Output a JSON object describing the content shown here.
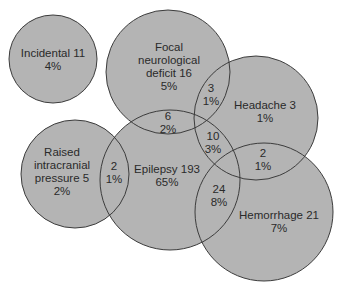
{
  "colors": {
    "fill": "#b4b4b4",
    "stroke": "#3c3c3c",
    "text": "#2a2a2a",
    "background": "#ffffff"
  },
  "sets": [
    {
      "id": "incidental",
      "lines": [
        "Incidental 11",
        "4%"
      ],
      "name": "Incidental",
      "count": 11,
      "percent": "4%",
      "cx": 53,
      "cy": 59,
      "r": 44,
      "lx": 53,
      "ly": 60
    },
    {
      "id": "focal",
      "lines": [
        "Focal",
        "neurological",
        "deficit 16",
        "5%"
      ],
      "name": "Focal neurological deficit",
      "count": 16,
      "percent": "5%",
      "cx": 168,
      "cy": 72,
      "r": 62,
      "lx": 169,
      "ly": 67
    },
    {
      "id": "headache",
      "lines": [
        "Headache 3",
        "1%"
      ],
      "name": "Headache",
      "count": 3,
      "percent": "1%",
      "cx": 256,
      "cy": 118,
      "r": 62,
      "lx": 265,
      "ly": 112
    },
    {
      "id": "raised-icp",
      "lines": [
        "Raised",
        "intracranial",
        "pressure 5",
        "2%"
      ],
      "name": "Raised intracranial pressure",
      "count": 5,
      "percent": "2%",
      "cx": 75,
      "cy": 174,
      "r": 54,
      "lx": 62,
      "ly": 172
    },
    {
      "id": "epilepsy",
      "lines": [
        "Epilepsy 193",
        "65%"
      ],
      "name": "Epilepsy",
      "count": 193,
      "percent": "65%",
      "cx": 170,
      "cy": 180,
      "r": 70,
      "lx": 167,
      "ly": 176
    },
    {
      "id": "hemorrhage",
      "lines": [
        "Hemorrhage 21",
        "7%"
      ],
      "name": "Hemorrhage",
      "count": 21,
      "percent": "7%",
      "cx": 264,
      "cy": 212,
      "r": 69,
      "lx": 279,
      "ly": 222
    }
  ],
  "intersections": [
    {
      "id": "focal-headache",
      "sets": [
        "Focal neurological deficit",
        "Headache"
      ],
      "lines": [
        "3",
        "1%"
      ],
      "count": 3,
      "percent": "1%",
      "lx": 211,
      "ly": 95
    },
    {
      "id": "focal-epilepsy",
      "sets": [
        "Focal neurological deficit",
        "Epilepsy"
      ],
      "lines": [
        "6",
        "2%"
      ],
      "count": 6,
      "percent": "2%",
      "lx": 168,
      "ly": 123
    },
    {
      "id": "epilepsy-headache",
      "sets": [
        "Epilepsy",
        "Headache"
      ],
      "lines": [
        "10",
        "3%"
      ],
      "count": 10,
      "percent": "3%",
      "lx": 213,
      "ly": 143
    },
    {
      "id": "raised-icp-epilepsy",
      "sets": [
        "Raised intracranial pressure",
        "Epilepsy"
      ],
      "lines": [
        "2",
        "1%"
      ],
      "count": 2,
      "percent": "1%",
      "lx": 114,
      "ly": 173
    },
    {
      "id": "headache-hemorrhage",
      "sets": [
        "Headache",
        "Hemorrhage"
      ],
      "lines": [
        "2",
        "1%"
      ],
      "count": 2,
      "percent": "1%",
      "lx": 263,
      "ly": 160
    },
    {
      "id": "epilepsy-hemorrhage",
      "sets": [
        "Epilepsy",
        "Hemorrhage"
      ],
      "lines": [
        "24",
        "8%"
      ],
      "count": 24,
      "percent": "8%",
      "lx": 219,
      "ly": 196
    }
  ]
}
